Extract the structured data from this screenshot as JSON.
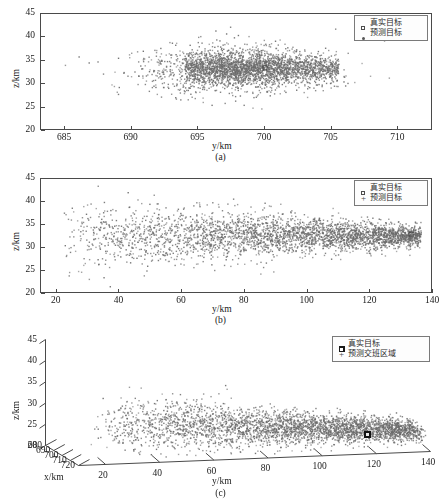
{
  "figure": {
    "background": "#ffffff",
    "point_color": "#6b6b6b",
    "axis_color": "#4a4a4a"
  },
  "chart_data": [
    {
      "id": "panel-a",
      "type": "scatter",
      "caption": "(a)",
      "title": "",
      "xlabel": "y/km",
      "ylabel": "z/km",
      "xlim": [
        683.2,
        712.6
      ],
      "ylim": [
        20,
        45
      ],
      "xticks": [
        685,
        690,
        695,
        700,
        705,
        710
      ],
      "yticks": [
        20,
        25,
        30,
        35,
        40,
        45
      ],
      "grid": false,
      "legend_position": "top-right",
      "legend": [
        {
          "label": "真实目标",
          "marker": "open-square"
        },
        {
          "label": "预测目标",
          "marker": "dot"
        }
      ],
      "series": [
        {
          "name": "预测目标",
          "marker": "dot",
          "color": "#6b6b6b",
          "n_points": 3000,
          "cluster": {
            "x_center": 697.8,
            "x_sigma": 3.3,
            "y_center": 33.2,
            "y_sigma": 2.5
          },
          "core": {
            "x_min": 694.0,
            "x_max": 705.5,
            "y_center": 33.5,
            "y_sigma": 1.4,
            "fraction": 0.45
          }
        },
        {
          "name": "真实目标",
          "marker": "open-square",
          "color": "#555555",
          "n_points": 1,
          "point": {
            "x": 700.0,
            "y": 33.5
          }
        }
      ]
    },
    {
      "id": "panel-b",
      "type": "scatter",
      "caption": "(b)",
      "title": "",
      "xlabel": "y/km",
      "ylabel": "z/km",
      "xlim": [
        15,
        140
      ],
      "ylim": [
        20,
        45
      ],
      "xticks": [
        20,
        40,
        60,
        80,
        100,
        120,
        140
      ],
      "yticks": [
        20,
        25,
        30,
        35,
        40,
        45
      ],
      "grid": false,
      "legend_position": "top-right",
      "legend": [
        {
          "label": "真实目标",
          "marker": "open-square"
        },
        {
          "label": "预测目标",
          "marker": "plus"
        }
      ],
      "series": [
        {
          "name": "预测目标",
          "marker": "dot",
          "color": "#6b6b6b",
          "n_points": 3200,
          "wedge": {
            "x_min": 22,
            "x_max": 136,
            "y_center": 32.8,
            "sigma_at_xmin": 4.2,
            "sigma_at_xmax": 1.1
          },
          "density_bias": 1.6
        },
        {
          "name": "真实目标",
          "marker": "open-square",
          "color": "#555555",
          "n_points": 1,
          "point": {
            "x": 133.0,
            "y": 33.0
          }
        }
      ]
    },
    {
      "id": "panel-c",
      "type": "scatter3d",
      "caption": "(c)",
      "title": "",
      "xlabel": "x/km",
      "ylabel": "y/km",
      "zlabel": "z/km",
      "xlim": [
        680,
        720
      ],
      "ylim": [
        10,
        140
      ],
      "zlim": [
        20,
        45
      ],
      "xticks": [
        680,
        690,
        700,
        710,
        720
      ],
      "yticks": [
        20,
        40,
        60,
        80,
        100,
        120,
        140
      ],
      "zticks": [
        20,
        25,
        30,
        35,
        40,
        45
      ],
      "grid": false,
      "legend_position": "top-right",
      "legend": [
        {
          "label": "真实目标",
          "marker": "filled-square"
        },
        {
          "label": "预测交班区域",
          "marker": "plus"
        }
      ],
      "series": [
        {
          "name": "预测交班区域",
          "marker": "dot",
          "color": "#6b6b6b",
          "n_points": 3400,
          "wedge": {
            "x_min": 22,
            "x_max": 130,
            "y_center": 27.5,
            "sigma_at_xmin": 3.6,
            "sigma_at_xmax": 1.0
          },
          "depth": {
            "min": 690,
            "max": 712
          },
          "density_bias": 1.5
        },
        {
          "name": "真实目标",
          "marker": "filled-square",
          "color": "#111111",
          "n_points": 1,
          "point": {
            "x": 112.0,
            "y": 26.5,
            "z": 705.0
          }
        }
      ]
    }
  ]
}
